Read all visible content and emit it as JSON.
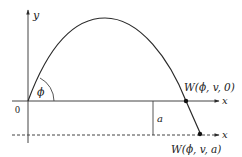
{
  "diagram": {
    "axes": {
      "y_label": "y",
      "x_label": "x",
      "origin_label": "0",
      "lower_axis_label": "x"
    },
    "angle_label": "ϕ",
    "height_offset_label": "a",
    "points": [
      {
        "name": "landing-at-ground",
        "label": "W(ϕ, v, 0)"
      },
      {
        "name": "landing-at-depth",
        "label": "W(ϕ, v, a)"
      }
    ],
    "colors": {
      "stroke": "#2a2a2a",
      "background": "#ffffff"
    }
  }
}
